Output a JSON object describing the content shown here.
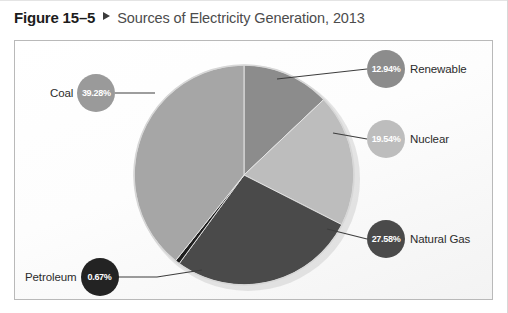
{
  "caption": {
    "figure_number": "Figure 15–5",
    "marker_icon": "triangle-right-icon",
    "title": "Sources of Electricity Generation, 2013"
  },
  "chart_data": {
    "type": "pie",
    "title": "Sources of Electricity Generation, 2013",
    "units": "percent",
    "total": 100,
    "start_angle_deg": 0,
    "direction": "clockwise",
    "legend_position": "callouts",
    "grid": false,
    "categories": [
      "Renewable",
      "Nuclear",
      "Natural Gas",
      "Petroleum",
      "Coal"
    ],
    "values": [
      12.94,
      19.54,
      27.58,
      0.67,
      39.28
    ],
    "labels": [
      "12.94%",
      "19.54%",
      "27.58%",
      "0.67%",
      "39.28%"
    ],
    "colors": [
      "#8c8c8c",
      "#bdbdbd",
      "#4a4a4a",
      "#1e1e1e",
      "#a6a6a6"
    ],
    "slices": [
      {
        "name": "Renewable",
        "value": 12.94,
        "label": "12.94%",
        "color": "#8c8c8c",
        "bubble_fill": "#8c8c8c",
        "bubble_text_color": "#ffffff",
        "callout_side": "right"
      },
      {
        "name": "Nuclear",
        "value": 19.54,
        "label": "19.54%",
        "color": "#bdbdbd",
        "bubble_fill": "#bdbdbd",
        "bubble_text_color": "#ffffff",
        "callout_side": "right"
      },
      {
        "name": "Natural Gas",
        "value": 27.58,
        "label": "27.58%",
        "color": "#4a4a4a",
        "bubble_fill": "#4a4a4a",
        "bubble_text_color": "#ffffff",
        "callout_side": "right"
      },
      {
        "name": "Petroleum",
        "value": 0.67,
        "label": "0.67%",
        "color": "#1e1e1e",
        "bubble_fill": "#232323",
        "bubble_text_color": "#ffffff",
        "callout_side": "left"
      },
      {
        "name": "Coal",
        "value": 39.28,
        "label": "39.28%",
        "color": "#a6a6a6",
        "bubble_fill": "#9a9a9a",
        "bubble_text_color": "#ffffff",
        "callout_side": "left"
      }
    ]
  },
  "style": {
    "panel_border": "#b9b9b9",
    "leader_line": "#3d3d3d",
    "pie_edge": "#d7d7d7",
    "caption_title_color": "#4c4c4c"
  }
}
